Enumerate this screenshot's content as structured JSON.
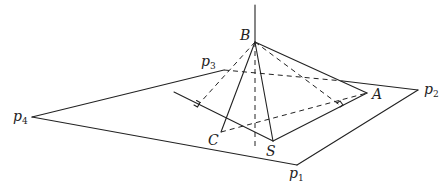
{
  "figure": {
    "labels": {
      "B": "B",
      "A": "A",
      "C": "C",
      "S": "S",
      "p1": "p",
      "p1_sub": "1",
      "p2": "p",
      "p2_sub": "2",
      "p3": "p",
      "p3_sub": "3",
      "p4": "p",
      "p4_sub": "4"
    },
    "points": {
      "B": [
        255,
        42
      ],
      "A": [
        367,
        93
      ],
      "C": [
        221,
        132
      ],
      "S": [
        273,
        141
      ],
      "p1": [
        297,
        165
      ],
      "p2": [
        418,
        90
      ],
      "p3": [
        224,
        70
      ],
      "p4": [
        32,
        117
      ]
    },
    "colors": {
      "stroke": "#222222",
      "background": "#ffffff"
    }
  }
}
